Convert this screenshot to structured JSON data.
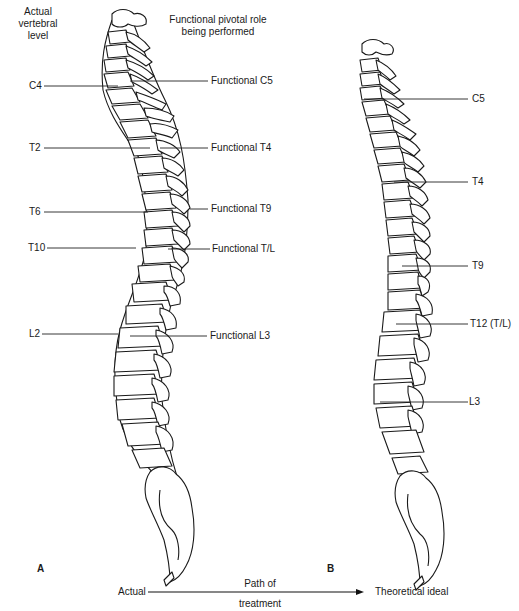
{
  "headers": {
    "left_col": "Actual vertebral level",
    "right_col": "Functional pivotal role being performed"
  },
  "panel_a": {
    "label": "A",
    "left_labels": [
      "C4",
      "T2",
      "T6",
      "T10",
      "L2"
    ],
    "right_labels": [
      "Functional C5",
      "Functional T4",
      "Functional T9",
      "Functional T/L",
      "Functional L3"
    ]
  },
  "panel_b": {
    "label": "B",
    "right_labels": [
      "C5",
      "T4",
      "T9",
      "T12 (T/L)",
      "L3"
    ]
  },
  "footer": {
    "start": "Actual",
    "path_line1": "Path of",
    "path_line2": "treatment",
    "end": "Theoretical ideal"
  }
}
